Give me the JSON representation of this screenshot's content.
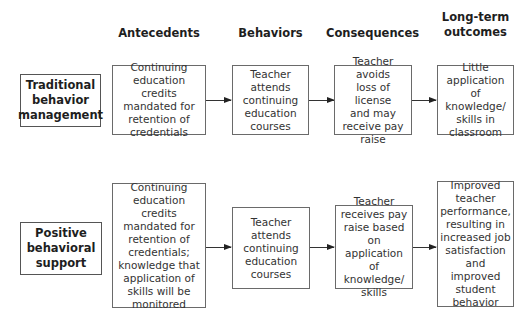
{
  "headers": {
    "antecedents": "Antecedents",
    "behaviors": "Behaviors",
    "consequences": "Consequences",
    "outcomes_line1": "Long-term",
    "outcomes_line2": "outcomes"
  },
  "rows": [
    {
      "label_lines": [
        "Traditional",
        "behavior",
        "management"
      ],
      "antecedent": [
        "Continuing",
        "education credits",
        "mandated for",
        "retention of",
        "credentials"
      ],
      "behavior": [
        "Teacher",
        "attends",
        "continuing",
        "education",
        "courses"
      ],
      "consequence": [
        "Teacher avoids",
        "loss of license",
        "and may",
        "receive pay",
        "raise"
      ],
      "outcome": [
        "Little",
        "application of",
        "knowledge/",
        "skills in",
        "classroom"
      ]
    },
    {
      "label_lines": [
        "Positive",
        "behavioral",
        "support"
      ],
      "antecedent": [
        "Continuing",
        "education credits",
        "mandated for",
        "retention of",
        "credentials;",
        "knowledge that",
        "application of",
        "skills will be",
        "monitored"
      ],
      "behavior": [
        "Teacher",
        "attends",
        "continuing",
        "education",
        "courses"
      ],
      "consequence": [
        "Teacher",
        "receives pay",
        "raise based on",
        "application of",
        "knowledge/",
        "skills"
      ],
      "outcome": [
        "Improved",
        "teacher",
        "performance,",
        "resulting in",
        "increased job",
        "satisfaction",
        "and improved",
        "student",
        "behavior"
      ]
    }
  ],
  "colors": {
    "border": "#6a6a6a",
    "text": "#333333",
    "arrow": "#222222"
  }
}
